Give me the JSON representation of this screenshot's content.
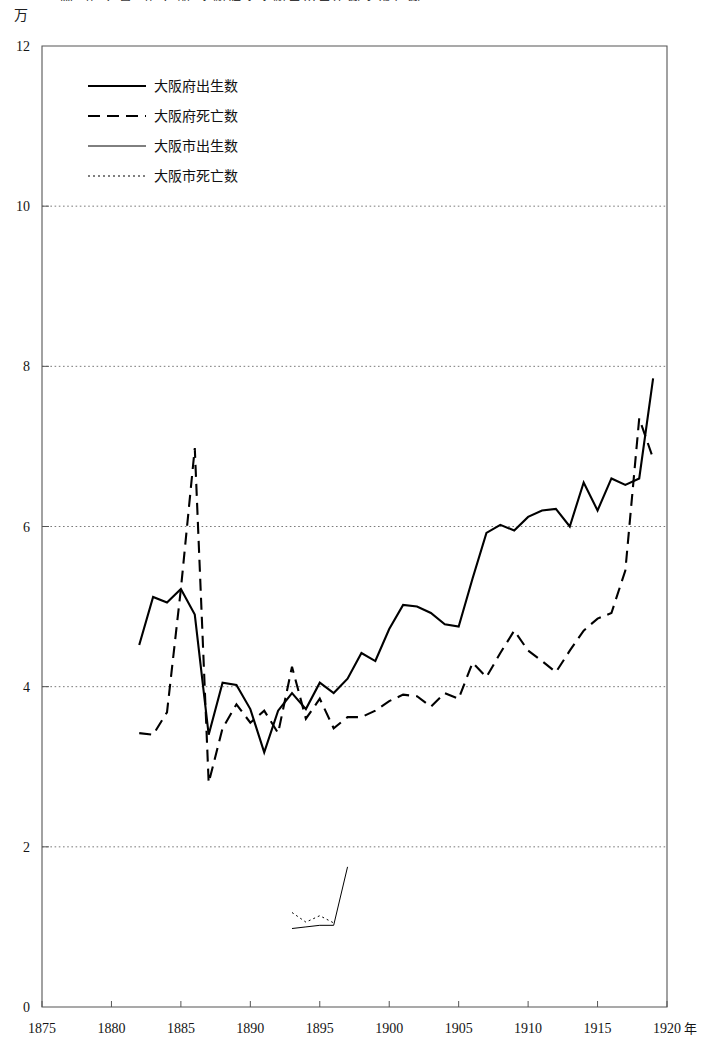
{
  "figure": {
    "unit_label": "万",
    "truncated_header": "図  第 2 章  第 1 節  大阪府・大阪市の出生数と死亡数",
    "axis_year_suffix": "年"
  },
  "chart_data": {
    "type": "line",
    "title": "",
    "subtitle": "",
    "xlabel": "年",
    "ylabel": "万",
    "xlim": [
      1875,
      1920
    ],
    "ylim": [
      0,
      12
    ],
    "xticks": [
      1875,
      1880,
      1885,
      1890,
      1895,
      1900,
      1905,
      1910,
      1915,
      1920
    ],
    "xticklabels": [
      "1875",
      "1880",
      "1885",
      "1890",
      "1895",
      "1900",
      "1905",
      "1910",
      "1915",
      "1920"
    ],
    "yticks": [
      0,
      2,
      4,
      6,
      8,
      10,
      12
    ],
    "yticklabels": [
      "0",
      "2",
      "4",
      "6",
      "8",
      "10",
      "12"
    ],
    "grid": "horizontal-dotted",
    "gridlines": [
      2,
      4,
      6,
      8,
      10
    ],
    "legend_position": "upper-left-inside",
    "series": [
      {
        "name": "大阪府出生数",
        "style": "solid",
        "width": 2.1,
        "color": "#000000",
        "x": [
          1882,
          1883,
          1884,
          1885,
          1886,
          1887,
          1888,
          1889,
          1890,
          1891,
          1892,
          1893,
          1894,
          1895,
          1896,
          1897,
          1898,
          1899,
          1900,
          1901,
          1902,
          1903,
          1904,
          1905,
          1906,
          1907,
          1908,
          1909,
          1910,
          1911,
          1912,
          1913,
          1914,
          1915,
          1916,
          1917,
          1918,
          1919
        ],
        "values": [
          4.52,
          5.12,
          5.05,
          5.22,
          4.9,
          3.4,
          4.05,
          4.02,
          3.72,
          3.18,
          3.7,
          3.92,
          3.72,
          4.05,
          3.92,
          4.1,
          4.42,
          4.32,
          4.72,
          5.02,
          5.0,
          4.92,
          4.78,
          4.75,
          5.35,
          5.92,
          6.02,
          5.95,
          6.12,
          6.2,
          6.22,
          6.0,
          6.55,
          6.2,
          6.6,
          6.52,
          6.6,
          7.85
        ]
      },
      {
        "name": "大阪府死亡数",
        "style": "dashed",
        "width": 2.1,
        "color": "#000000",
        "x": [
          1882,
          1883,
          1884,
          1885,
          1886,
          1887,
          1888,
          1889,
          1890,
          1891,
          1892,
          1893,
          1894,
          1895,
          1896,
          1897,
          1898,
          1899,
          1900,
          1901,
          1902,
          1903,
          1904,
          1905,
          1906,
          1907,
          1908,
          1909,
          1910,
          1911,
          1912,
          1913,
          1914,
          1915,
          1916,
          1917,
          1918,
          1919
        ],
        "values": [
          3.42,
          3.4,
          3.68,
          5.22,
          6.98,
          2.8,
          3.48,
          3.78,
          3.55,
          3.7,
          3.42,
          4.25,
          3.6,
          3.85,
          3.48,
          3.62,
          3.62,
          3.7,
          3.82,
          3.9,
          3.88,
          3.75,
          3.92,
          3.85,
          4.3,
          4.12,
          4.42,
          4.7,
          4.45,
          4.32,
          4.18,
          4.45,
          4.7,
          4.85,
          4.92,
          5.45,
          7.35,
          6.85
        ]
      },
      {
        "name": "大阪市出生数",
        "style": "solid",
        "width": 1.0,
        "color": "#000000",
        "x": [
          1893,
          1894,
          1895,
          1896,
          1897
        ],
        "values": [
          0.98,
          1.0,
          1.02,
          1.02,
          1.75
        ]
      },
      {
        "name": "大阪市死亡数",
        "style": "dotted",
        "width": 1.0,
        "color": "#000000",
        "x": [
          1893,
          1894,
          1895,
          1896
        ],
        "values": [
          1.18,
          1.06,
          1.14,
          1.05
        ]
      }
    ]
  }
}
